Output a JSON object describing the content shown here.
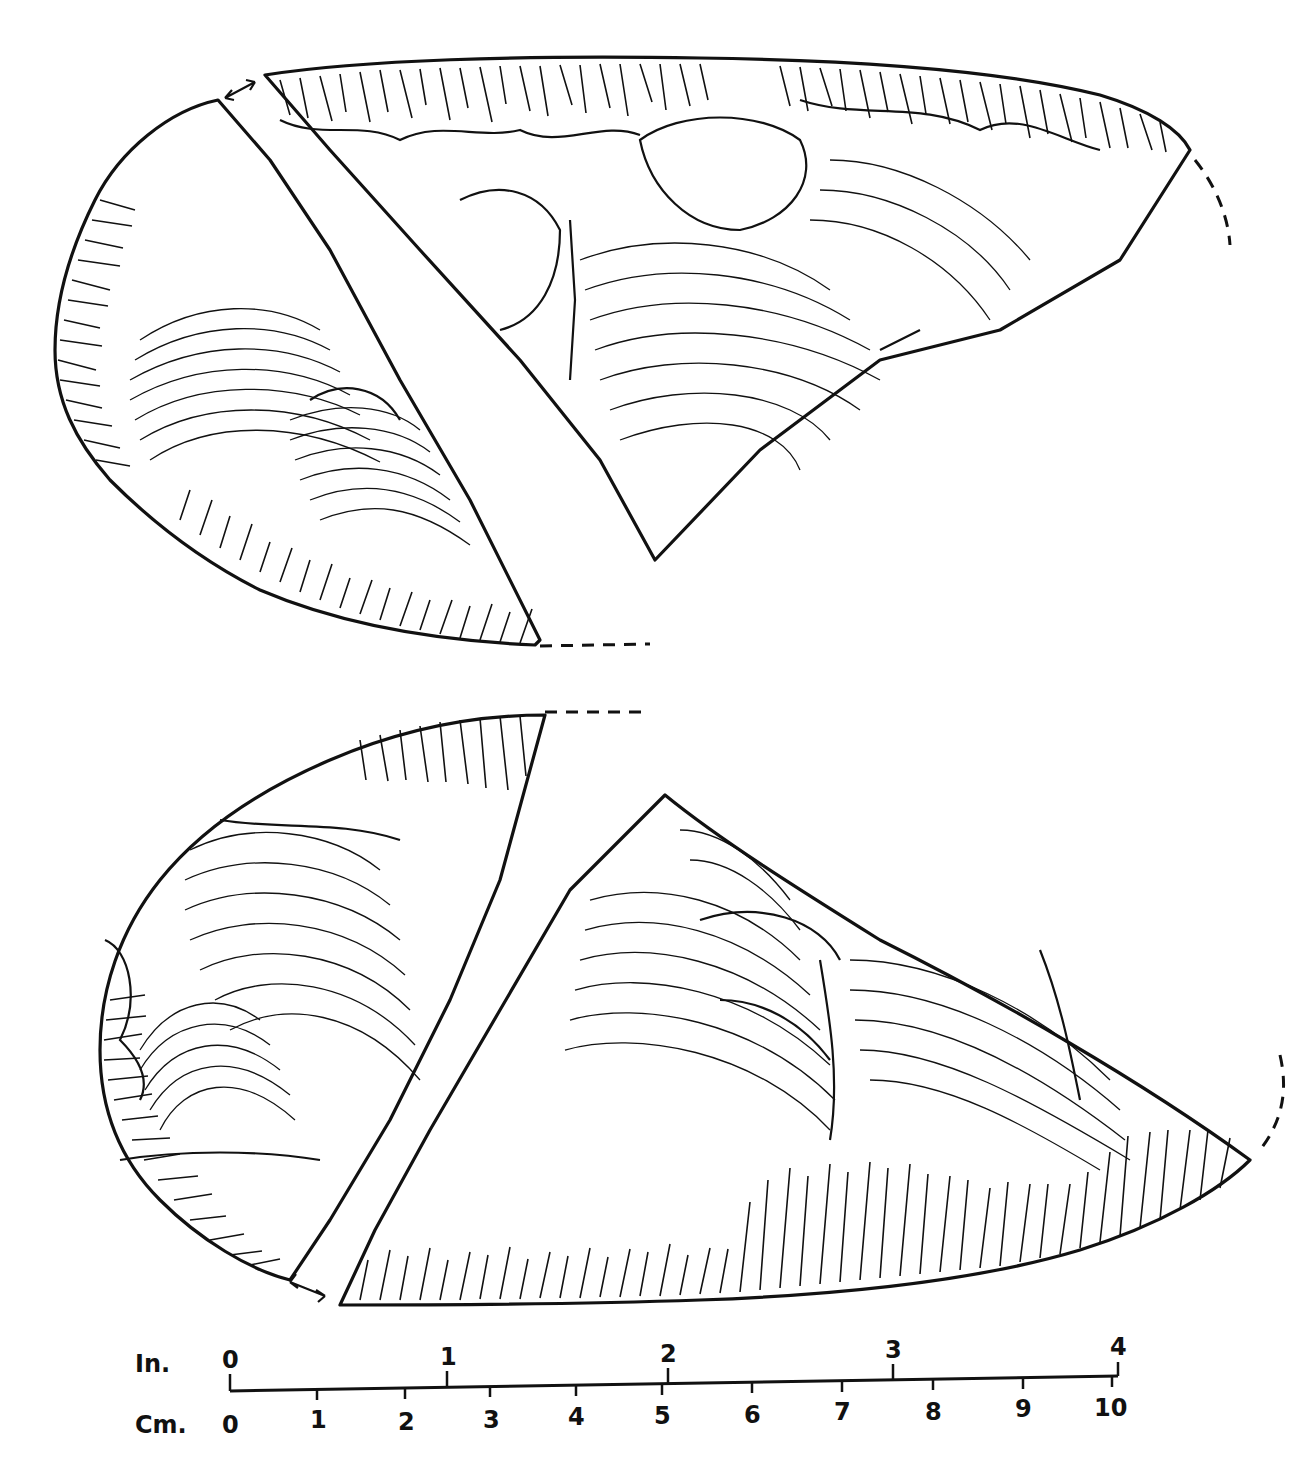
{
  "figure": {
    "views": [
      {
        "name": "upper-face",
        "fragments": 2
      },
      {
        "name": "lower-face",
        "fragments": 2
      }
    ]
  },
  "scale": {
    "inch_label": "In.",
    "cm_label": "Cm.",
    "inch_ticks": [
      "0",
      "1",
      "2",
      "3",
      "4"
    ],
    "cm_ticks": [
      "0",
      "1",
      "2",
      "3",
      "4",
      "5",
      "6",
      "7",
      "8",
      "9",
      "10"
    ]
  }
}
